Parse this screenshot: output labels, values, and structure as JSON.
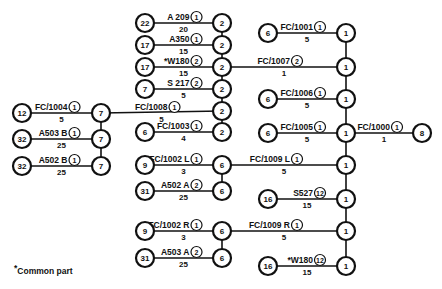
{
  "diagram": {
    "type": "wiring-assembly-tree",
    "nodes": [
      {
        "id": "n12",
        "label": "12",
        "x": 22,
        "y": 113
      },
      {
        "id": "n32a",
        "label": "32",
        "x": 22,
        "y": 139
      },
      {
        "id": "n32b",
        "label": "32",
        "x": 22,
        "y": 166
      },
      {
        "id": "L7a",
        "label": "7",
        "x": 101,
        "y": 113
      },
      {
        "id": "L7b",
        "label": "7",
        "x": 101,
        "y": 139
      },
      {
        "id": "L7c",
        "label": "7",
        "x": 101,
        "y": 166
      },
      {
        "id": "s22",
        "label": "22",
        "x": 145,
        "y": 23
      },
      {
        "id": "s17a",
        "label": "17",
        "x": 145,
        "y": 45
      },
      {
        "id": "s17b",
        "label": "17",
        "x": 145,
        "y": 67
      },
      {
        "id": "s7",
        "label": "7",
        "x": 145,
        "y": 89
      },
      {
        "id": "s6",
        "label": "6",
        "x": 145,
        "y": 132
      },
      {
        "id": "c2a",
        "label": "2",
        "x": 222,
        "y": 23
      },
      {
        "id": "c2b",
        "label": "2",
        "x": 222,
        "y": 45
      },
      {
        "id": "c2c",
        "label": "2",
        "x": 222,
        "y": 67
      },
      {
        "id": "c2d",
        "label": "2",
        "x": 222,
        "y": 89
      },
      {
        "id": "c2e",
        "label": "2",
        "x": 222,
        "y": 111
      },
      {
        "id": "c2f",
        "label": "2",
        "x": 222,
        "y": 132
      },
      {
        "id": "s9a",
        "label": "9",
        "x": 145,
        "y": 165
      },
      {
        "id": "s31a",
        "label": "31",
        "x": 145,
        "y": 191
      },
      {
        "id": "s9b",
        "label": "9",
        "x": 145,
        "y": 231
      },
      {
        "id": "s31b",
        "label": "31",
        "x": 145,
        "y": 258
      },
      {
        "id": "c6a",
        "label": "6",
        "x": 222,
        "y": 165
      },
      {
        "id": "c6b",
        "label": "6",
        "x": 222,
        "y": 191
      },
      {
        "id": "c6c",
        "label": "6",
        "x": 222,
        "y": 231
      },
      {
        "id": "c6d",
        "label": "6",
        "x": 222,
        "y": 258
      },
      {
        "id": "r6a",
        "label": "6",
        "x": 268,
        "y": 33
      },
      {
        "id": "r6b",
        "label": "6",
        "x": 268,
        "y": 99
      },
      {
        "id": "r6c",
        "label": "6",
        "x": 268,
        "y": 133
      },
      {
        "id": "r16a",
        "label": "16",
        "x": 268,
        "y": 199
      },
      {
        "id": "r16b",
        "label": "16",
        "x": 268,
        "y": 266
      },
      {
        "id": "c1a",
        "label": "1",
        "x": 346,
        "y": 33
      },
      {
        "id": "c1b",
        "label": "1",
        "x": 346,
        "y": 67
      },
      {
        "id": "c1c",
        "label": "1",
        "x": 346,
        "y": 99
      },
      {
        "id": "c1d",
        "label": "1",
        "x": 346,
        "y": 133
      },
      {
        "id": "c1e",
        "label": "1",
        "x": 346,
        "y": 165
      },
      {
        "id": "c1f",
        "label": "1",
        "x": 346,
        "y": 199
      },
      {
        "id": "c1g",
        "label": "1",
        "x": 346,
        "y": 231
      },
      {
        "id": "c1h",
        "label": "1",
        "x": 346,
        "y": 266
      },
      {
        "id": "final",
        "label": "8",
        "x": 422,
        "y": 133
      }
    ],
    "links": [
      {
        "from": "n12",
        "to": "L7a",
        "part": "FC/1004",
        "badge": "1",
        "qty": "5",
        "common": false
      },
      {
        "from": "n32a",
        "to": "L7b",
        "part": "A503  B",
        "badge": "1",
        "qty": "25",
        "common": false
      },
      {
        "from": "n32b",
        "to": "L7c",
        "part": "A502  B",
        "badge": "1",
        "qty": "25",
        "common": false
      },
      {
        "from": "L7a",
        "to": "c2e",
        "part": "FC/1008",
        "badge": "1",
        "qty": "5",
        "common": false
      },
      {
        "from": "s22",
        "to": "c2a",
        "part": "A 209",
        "badge": "1",
        "qty": "20",
        "common": false
      },
      {
        "from": "s17a",
        "to": "c2b",
        "part": "A350",
        "badge": "1",
        "qty": "15",
        "common": false
      },
      {
        "from": "s17b",
        "to": "c2c",
        "part": "W180",
        "badge": "2",
        "qty": "15",
        "common": true
      },
      {
        "from": "s7",
        "to": "c2d",
        "part": "S 217",
        "badge": "2",
        "qty": "5",
        "common": false
      },
      {
        "from": "s6",
        "to": "c2f",
        "part": "FC/1003",
        "badge": "1",
        "qty": "4",
        "common": false
      },
      {
        "from": "c2c",
        "to": "c1b",
        "part": "FC/1007",
        "badge": "2",
        "qty": "1",
        "common": false
      },
      {
        "from": "s9a",
        "to": "c6a",
        "part": "FC/1002 L",
        "badge": "1",
        "qty": "3",
        "common": false
      },
      {
        "from": "s31a",
        "to": "c6b",
        "part": "A502  A",
        "badge": "2",
        "qty": "25",
        "common": false
      },
      {
        "from": "s9b",
        "to": "c6c",
        "part": "FC/1002 R",
        "badge": "1",
        "qty": "3",
        "common": false
      },
      {
        "from": "s31b",
        "to": "c6d",
        "part": "A503  A",
        "badge": "2",
        "qty": "25",
        "common": false
      },
      {
        "from": "c6a",
        "to": "c1e",
        "part": "FC/1009 L",
        "badge": "1",
        "qty": "5",
        "common": false
      },
      {
        "from": "c6c",
        "to": "c1g",
        "part": "FC/1009  R",
        "badge": "1",
        "qty": "5",
        "common": false
      },
      {
        "from": "r6a",
        "to": "c1a",
        "part": "FC/1001",
        "badge": "1",
        "qty": "5",
        "common": false
      },
      {
        "from": "r6b",
        "to": "c1c",
        "part": "FC/1006",
        "badge": "1",
        "qty": "5",
        "common": false
      },
      {
        "from": "r6c",
        "to": "c1d",
        "part": "FC/1005",
        "badge": "1",
        "qty": "5",
        "common": false
      },
      {
        "from": "r16a",
        "to": "c1f",
        "part": "S527",
        "badge": "12",
        "qty": "15",
        "common": false
      },
      {
        "from": "r16b",
        "to": "c1h",
        "part": "W180",
        "badge": "12",
        "qty": "15",
        "common": true
      },
      {
        "from": "c1d",
        "to": "final",
        "part": "FC/1000",
        "badge": "1",
        "qty": "1",
        "common": false
      }
    ],
    "buses": [
      {
        "x": 101,
        "y1": 113,
        "y2": 166
      },
      {
        "x": 222,
        "y1": 23,
        "y2": 132
      },
      {
        "x": 222,
        "y1": 165,
        "y2": 191
      },
      {
        "x": 222,
        "y1": 231,
        "y2": 258
      },
      {
        "x": 346,
        "y1": 33,
        "y2": 266
      }
    ]
  },
  "legend": {
    "star": "*",
    "text": "Common part"
  }
}
